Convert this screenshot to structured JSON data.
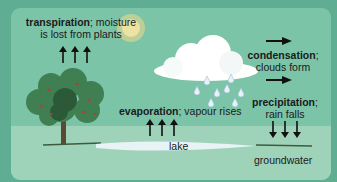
{
  "diagram": {
    "colors": {
      "background": "#5fae93",
      "panel": "#7cc4a8",
      "ground": "#9fd3b9",
      "lake": "#e8f3f6",
      "cloud": "#ffffff",
      "raindrop": "#cde6f5",
      "sun": "#f3d98a",
      "tree_canopy": "#3f7f52",
      "tree_dark": "#2c5a38",
      "tree_accent": "#a4473b",
      "trunk": "#5a4a33",
      "arrow": "#111111",
      "text": "#1a1a1a"
    },
    "labels": {
      "transpiration": {
        "term": "transpiration",
        "rest_line1": "; moisture",
        "line2": "is lost from plants"
      },
      "condensation": {
        "term": "condensation",
        "rest": ";",
        "line2": "clouds form"
      },
      "evaporation": {
        "term": "evaporation",
        "rest": "; vapour rises"
      },
      "precipitation": {
        "term": "precipitation",
        "rest": ";",
        "line2": "rain falls"
      },
      "lake": "lake",
      "groundwater": "groundwater"
    },
    "arrows": {
      "transpiration": {
        "direction": "up",
        "count": 3
      },
      "condensation": {
        "direction": "right",
        "count": 2
      },
      "evaporation": {
        "direction": "up",
        "count": 3
      },
      "precipitation": {
        "direction": "down",
        "count": 3
      }
    },
    "icons": [
      "sun-icon",
      "cloud-icon",
      "raindrop-icon",
      "tree-icon",
      "lake-icon"
    ]
  }
}
